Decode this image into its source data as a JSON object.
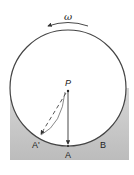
{
  "diagram": {
    "angular_velocity_label": "ω",
    "center_label": "P",
    "labels": {
      "a": "A",
      "a_prime": "A'",
      "b": "B"
    },
    "colors": {
      "ground": "#c9c9c9",
      "circle_fill": "#ffffff",
      "stroke": "#333333"
    }
  }
}
